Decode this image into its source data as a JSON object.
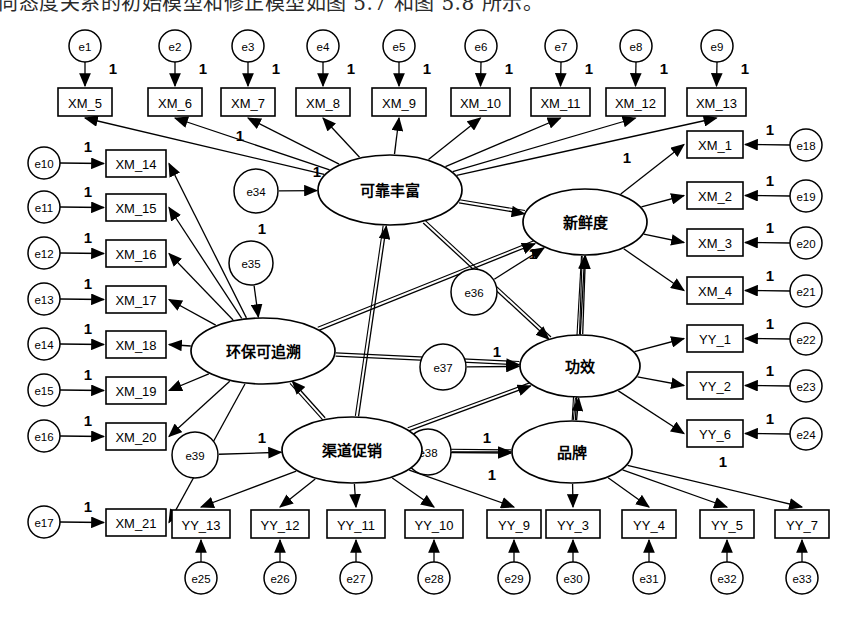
{
  "caption": {
    "text": "向态度关系的初始模型和修正模型如图 5.7 和图 5.8 所示。"
  },
  "diagram": {
    "type": "sem-path-diagram",
    "colors": {
      "stroke": "#000000",
      "fill": "#ffffff",
      "background": "#ffffff"
    },
    "fixed_loading_label": "1",
    "latent_variables": [
      {
        "id": "L1",
        "label": "可靠丰富",
        "cx": 390,
        "cy": 190,
        "rx": 72,
        "ry": 35
      },
      {
        "id": "L2",
        "label": "新鲜度",
        "cx": 585,
        "cy": 222,
        "rx": 62,
        "ry": 33
      },
      {
        "id": "L3",
        "label": "环保可追溯",
        "cx": 263,
        "cy": 351,
        "rx": 72,
        "ry": 33
      },
      {
        "id": "L4",
        "label": "功效",
        "cx": 580,
        "cy": 366,
        "rx": 60,
        "ry": 31
      },
      {
        "id": "L5",
        "label": "渠道促销",
        "cx": 352,
        "cy": 450,
        "rx": 70,
        "ry": 33
      },
      {
        "id": "L6",
        "label": "品牌",
        "cx": 572,
        "cy": 452,
        "rx": 60,
        "ry": 31
      }
    ],
    "observed_top": [
      {
        "label": "XM_5",
        "x": 58,
        "y": 88,
        "w": 54,
        "h": 28,
        "err": "e1",
        "ecx": 85,
        "ecy": 46
      },
      {
        "label": "XM_6",
        "x": 148,
        "y": 88,
        "w": 54,
        "h": 28,
        "err": "e2",
        "ecx": 175,
        "ecy": 46
      },
      {
        "label": "XM_7",
        "x": 221,
        "y": 88,
        "w": 54,
        "h": 28,
        "err": "e3",
        "ecx": 248,
        "ecy": 46
      },
      {
        "label": "XM_8",
        "x": 296,
        "y": 88,
        "w": 54,
        "h": 28,
        "err": "e4",
        "ecx": 323,
        "ecy": 46
      },
      {
        "label": "XM_9",
        "x": 372,
        "y": 88,
        "w": 54,
        "h": 28,
        "err": "e5",
        "ecx": 399,
        "ecy": 46
      },
      {
        "label": "XM_10",
        "x": 451,
        "y": 88,
        "w": 59,
        "h": 28,
        "err": "e6",
        "ecx": 481,
        "ecy": 46
      },
      {
        "label": "XM_11",
        "x": 531,
        "y": 88,
        "w": 59,
        "h": 28,
        "err": "e7",
        "ecx": 561,
        "ecy": 46
      },
      {
        "label": "XM_12",
        "x": 606,
        "y": 88,
        "w": 59,
        "h": 28,
        "err": "e8",
        "ecx": 636,
        "ecy": 46
      },
      {
        "label": "XM_13",
        "x": 687,
        "y": 88,
        "w": 59,
        "h": 28,
        "err": "e9",
        "ecx": 717,
        "ecy": 46
      }
    ],
    "observed_left": [
      {
        "label": "XM_14",
        "x": 106,
        "y": 150,
        "w": 60,
        "h": 27,
        "err": "e10",
        "ecx": 44,
        "ecy": 163
      },
      {
        "label": "XM_15",
        "x": 106,
        "y": 194,
        "w": 60,
        "h": 27,
        "err": "e11",
        "ecx": 44,
        "ecy": 207
      },
      {
        "label": "XM_16",
        "x": 106,
        "y": 240,
        "w": 60,
        "h": 27,
        "err": "e12",
        "ecx": 44,
        "ecy": 253
      },
      {
        "label": "XM_17",
        "x": 106,
        "y": 286,
        "w": 60,
        "h": 27,
        "err": "e13",
        "ecx": 44,
        "ecy": 299
      },
      {
        "label": "XM_18",
        "x": 106,
        "y": 331,
        "w": 60,
        "h": 27,
        "err": "e14",
        "ecx": 44,
        "ecy": 344
      },
      {
        "label": "XM_19",
        "x": 106,
        "y": 377,
        "w": 60,
        "h": 27,
        "err": "e15",
        "ecx": 44,
        "ecy": 390
      },
      {
        "label": "XM_20",
        "x": 106,
        "y": 423,
        "w": 60,
        "h": 27,
        "err": "e16",
        "ecx": 44,
        "ecy": 436
      },
      {
        "label": "XM_21",
        "x": 106,
        "y": 509,
        "w": 60,
        "h": 27,
        "err": "e17",
        "ecx": 44,
        "ecy": 522
      }
    ],
    "observed_right": [
      {
        "label": "XM_1",
        "x": 687,
        "y": 131,
        "w": 56,
        "h": 27,
        "err": "e18",
        "ecx": 806,
        "ecy": 145
      },
      {
        "label": "XM_2",
        "x": 687,
        "y": 182,
        "w": 56,
        "h": 27,
        "err": "e19",
        "ecx": 806,
        "ecy": 196
      },
      {
        "label": "XM_3",
        "x": 687,
        "y": 229,
        "w": 56,
        "h": 27,
        "err": "e20",
        "ecx": 806,
        "ecy": 243
      },
      {
        "label": "XM_4",
        "x": 687,
        "y": 277,
        "w": 56,
        "h": 27,
        "err": "e21",
        "ecx": 806,
        "ecy": 291
      },
      {
        "label": "YY_1",
        "x": 687,
        "y": 325,
        "w": 56,
        "h": 27,
        "err": "e22",
        "ecx": 806,
        "ecy": 339
      },
      {
        "label": "YY_2",
        "x": 687,
        "y": 372,
        "w": 56,
        "h": 27,
        "err": "e23",
        "ecx": 806,
        "ecy": 386
      },
      {
        "label": "YY_6",
        "x": 687,
        "y": 420,
        "w": 56,
        "h": 27,
        "err": "e24",
        "ecx": 806,
        "ecy": 434
      }
    ],
    "observed_bottom": [
      {
        "label": "YY_13",
        "x": 172,
        "y": 510,
        "w": 58,
        "h": 28,
        "err": "e25",
        "ecx": 201,
        "ecy": 578
      },
      {
        "label": "YY_12",
        "x": 251,
        "y": 510,
        "w": 58,
        "h": 28,
        "err": "e26",
        "ecx": 280,
        "ecy": 578
      },
      {
        "label": "YY_11",
        "x": 327,
        "y": 510,
        "w": 58,
        "h": 28,
        "err": "e27",
        "ecx": 356,
        "ecy": 578
      },
      {
        "label": "YY_10",
        "x": 405,
        "y": 510,
        "w": 58,
        "h": 28,
        "err": "e28",
        "ecx": 434,
        "ecy": 578
      },
      {
        "label": "YY_9",
        "x": 487,
        "y": 510,
        "w": 54,
        "h": 28,
        "err": "e29",
        "ecx": 514,
        "ecy": 578
      },
      {
        "label": "YY_3",
        "x": 546,
        "y": 510,
        "w": 54,
        "h": 28,
        "err": "e30",
        "ecx": 573,
        "ecy": 578
      },
      {
        "label": "YY_4",
        "x": 622,
        "y": 510,
        "w": 54,
        "h": 28,
        "err": "e31",
        "ecx": 649,
        "ecy": 578
      },
      {
        "label": "YY_5",
        "x": 700,
        "y": 510,
        "w": 54,
        "h": 28,
        "err": "e32",
        "ecx": 727,
        "ecy": 578
      },
      {
        "label": "YY_7",
        "x": 775,
        "y": 510,
        "w": 54,
        "h": 28,
        "err": "e33",
        "ecx": 802,
        "ecy": 578
      }
    ],
    "structural_residuals": [
      {
        "label": "e34",
        "cx": 256,
        "cy": 191,
        "r": 22,
        "target": "可靠丰富"
      },
      {
        "label": "e35",
        "cx": 251,
        "cy": 263,
        "r": 22,
        "target": "环保可追溯"
      },
      {
        "label": "e36",
        "cx": 474,
        "cy": 292,
        "r": 23,
        "target": "新鲜度"
      },
      {
        "label": "e37",
        "cx": 443,
        "cy": 367,
        "r": 23,
        "target": "功效"
      },
      {
        "label": "e38",
        "cx": 428,
        "cy": 452,
        "r": 23,
        "target": "品牌"
      },
      {
        "label": "e39",
        "cx": 195,
        "cy": 455,
        "r": 23,
        "target": "渠道促销"
      }
    ],
    "ones": [
      {
        "x": 113,
        "y": 68
      },
      {
        "x": 203,
        "y": 68
      },
      {
        "x": 276,
        "y": 68
      },
      {
        "x": 351,
        "y": 68
      },
      {
        "x": 427,
        "y": 68
      },
      {
        "x": 509,
        "y": 68
      },
      {
        "x": 589,
        "y": 68
      },
      {
        "x": 664,
        "y": 68
      },
      {
        "x": 745,
        "y": 68
      },
      {
        "x": 88,
        "y": 146
      },
      {
        "x": 88,
        "y": 191
      },
      {
        "x": 88,
        "y": 237
      },
      {
        "x": 88,
        "y": 283
      },
      {
        "x": 88,
        "y": 328
      },
      {
        "x": 88,
        "y": 374
      },
      {
        "x": 88,
        "y": 420
      },
      {
        "x": 88,
        "y": 506
      },
      {
        "x": 770,
        "y": 129
      },
      {
        "x": 770,
        "y": 180
      },
      {
        "x": 770,
        "y": 227
      },
      {
        "x": 770,
        "y": 275
      },
      {
        "x": 770,
        "y": 323
      },
      {
        "x": 770,
        "y": 370
      },
      {
        "x": 770,
        "y": 418
      },
      {
        "x": 240,
        "y": 135
      },
      {
        "x": 317,
        "y": 171
      },
      {
        "x": 627,
        "y": 157
      },
      {
        "x": 262,
        "y": 228
      },
      {
        "x": 533,
        "y": 253
      },
      {
        "x": 497,
        "y": 351
      },
      {
        "x": 262,
        "y": 437
      },
      {
        "x": 487,
        "y": 437
      },
      {
        "x": 492,
        "y": 474
      },
      {
        "x": 723,
        "y": 461
      }
    ]
  }
}
